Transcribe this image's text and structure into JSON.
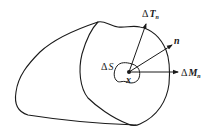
{
  "figure": {
    "colors": {
      "stroke": "#1a1a1a",
      "background": "#ffffff"
    },
    "labels": {
      "traction": {
        "delta": "Δ",
        "symbol": "T",
        "subscript": "n"
      },
      "normal": {
        "symbol": "n"
      },
      "moment": {
        "delta": "Δ",
        "symbol": "M",
        "subscript": "n"
      },
      "area_element": {
        "delta": "Δ",
        "symbol": "S"
      },
      "point": {
        "symbol": "x"
      }
    },
    "vectors": [
      {
        "name": "traction-vector",
        "from": [
          129,
          72
        ],
        "to": [
          146,
          24
        ]
      },
      {
        "name": "normal-vector",
        "from": [
          129,
          72
        ],
        "to": [
          172,
          45
        ]
      },
      {
        "name": "moment-vector",
        "from": [
          129,
          72
        ],
        "to": [
          178,
          72
        ]
      }
    ]
  }
}
